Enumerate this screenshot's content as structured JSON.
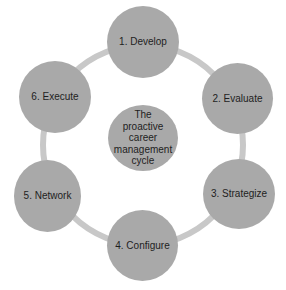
{
  "diagram": {
    "type": "cycle",
    "center": {
      "label": "The proactive career management cycle"
    },
    "steps": [
      {
        "label": "1. Develop"
      },
      {
        "label": "2. Evaluate"
      },
      {
        "label": "3. Strategize"
      },
      {
        "label": "4. Configure"
      },
      {
        "label": "5. Network"
      },
      {
        "label": "6. Execute"
      }
    ],
    "colors": {
      "node_fill": "#a9a9a9",
      "connector": "#c8c8c8",
      "text": "#1e1e1e",
      "background": "#ffffff"
    }
  }
}
